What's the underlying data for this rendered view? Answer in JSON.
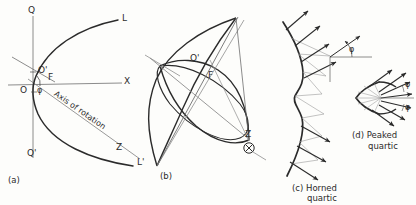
{
  "figure": {
    "ink_color": "#2b2b2b",
    "light_ink_color": "#8d8d8d",
    "background_color": "#fdfdfb"
  },
  "panel_a": {
    "caption": "(a)",
    "labels": {
      "q_top": "Q",
      "q_bottom": "Q'",
      "x_axis": "X",
      "l_upper": "L",
      "l_lower": "L'",
      "z_point": "Z",
      "origin": "O",
      "origin_prime": "O'",
      "focus": "F",
      "angle_phi": "φ",
      "axis_of_rotation": "Axis of rotation"
    }
  },
  "panel_b": {
    "caption": "(b)",
    "labels": {
      "origin_prime": "O'",
      "focus": "F",
      "z_point": "Z"
    }
  },
  "panel_c": {
    "caption_line1": "(c) Horned",
    "caption_line2": "quartic",
    "labels": {
      "angle_phi": "φ"
    }
  },
  "panel_d": {
    "caption_line1": "(d) Peaked",
    "caption_line2": "quartic",
    "labels": {
      "angle_phi_upper": "φ",
      "angle_phi_lower": "φ"
    }
  }
}
